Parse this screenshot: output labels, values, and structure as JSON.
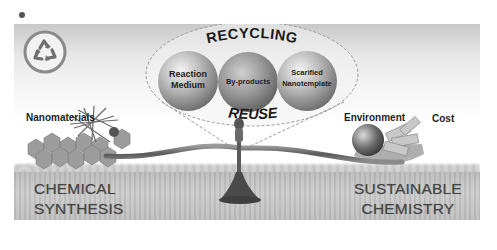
{
  "figure": {
    "panel_marker": "•",
    "theme_colors": {
      "sky_top": "#c8c8c8",
      "background": "#ffffff",
      "field": "#c0c0c0",
      "text_dark": "#1f1f1f",
      "caption_text": "#444444",
      "sphere_light": "#e8e8e8",
      "sphere_dark": "#7a7a7a"
    },
    "recycle_icon": {
      "name": "recycle-icon",
      "glyph": "♻"
    },
    "bubble": {
      "title_top": "RECYCLING",
      "title_bottom": "REUSE",
      "spheres": [
        {
          "line1": "Reaction",
          "line2": "Medium"
        },
        {
          "line1": "By-products",
          "line2": ""
        },
        {
          "line1": "Scarified",
          "line2": "Nanotemplate"
        }
      ]
    },
    "left": {
      "item_label": "Nanomaterials",
      "caption_line1": "CHEMICAL",
      "caption_line2": "SYNTHESIS"
    },
    "right": {
      "item_label_1": "Environment",
      "item_label_2": "Cost",
      "caption_line1": "SUSTAINABLE",
      "caption_line2": "CHEMISTRY"
    }
  }
}
